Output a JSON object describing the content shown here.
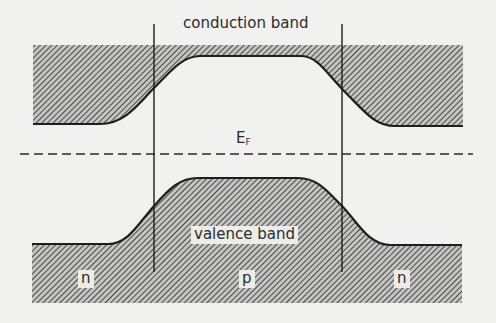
{
  "diagram": {
    "labels": {
      "conduction_band": "conduction band",
      "fermi_level_main": "E",
      "fermi_level_sub": "F",
      "valence_band": "valence band",
      "region_left": "n",
      "region_middle": "p",
      "region_right": "n"
    },
    "regions": [
      "n",
      "p",
      "n"
    ],
    "colors": {
      "background": "#f1f1ef",
      "line": "#1e1e1e",
      "hatch": "#3a3a3a",
      "hatch_bg": "#bdbdbb",
      "text": "#2b2b2b"
    },
    "geometry": {
      "junction_left_x": 154,
      "junction_right_x": 342,
      "fermi_level_y": 154,
      "conduction_band_top_y": 45,
      "conduction_band_edge_n_y": 125,
      "conduction_band_edge_p_y": 56,
      "valence_band_edge_n_y": 245,
      "valence_band_edge_p_y": 178,
      "valence_band_bottom_y": 303
    }
  }
}
